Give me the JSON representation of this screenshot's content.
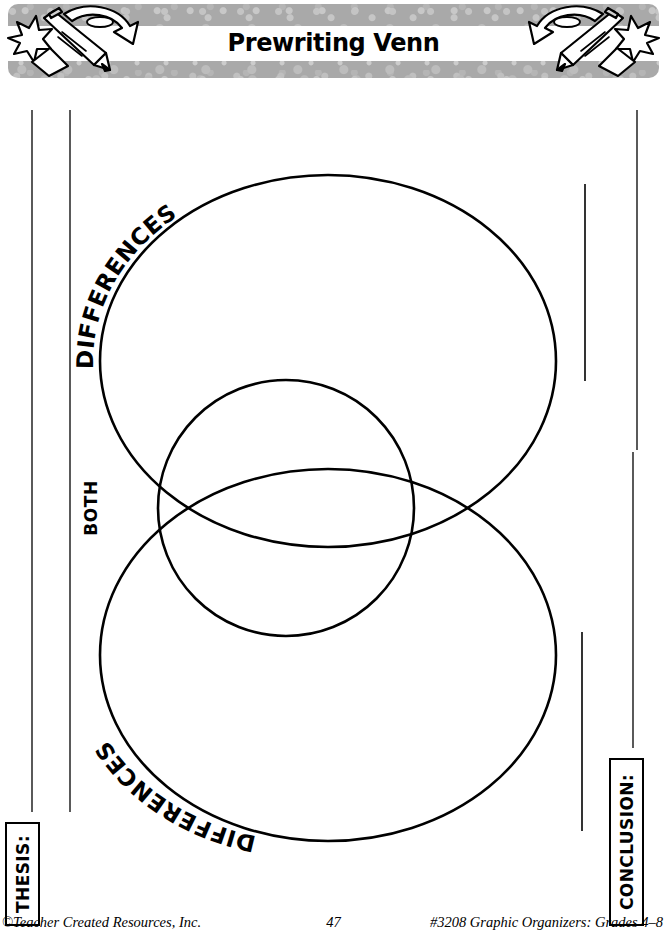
{
  "page": {
    "title": "Prewriting Venn",
    "width": 667,
    "height": 938,
    "background": "#ffffff",
    "ink": "#000000"
  },
  "banner": {
    "title": "Prewriting Venn",
    "band_color": "#a9a9a9",
    "strip_color": "#ffffff",
    "left_art": "pencil-star-paper-arrow-icon",
    "right_art": "pencil-star-paper-arrow-icon"
  },
  "diagram": {
    "type": "venn",
    "orientation": "vertical",
    "labels": {
      "top": "DIFFERENCES",
      "bottom": "DIFFERENCES",
      "middle": "BOTH"
    },
    "shapes": {
      "upper_ellipse": {
        "cx": 328,
        "cy": 283,
        "rx": 228,
        "ry": 186
      },
      "lower_ellipse": {
        "cx": 328,
        "cy": 577,
        "rx": 228,
        "ry": 186
      },
      "middle_circle": {
        "cx": 286,
        "cy": 430,
        "r": 128
      }
    },
    "stroke_width": 2.4
  },
  "writing_lines": {
    "left": [
      {
        "x": 32,
        "y1": 110,
        "y2": 812
      },
      {
        "x": 70,
        "y1": 110,
        "y2": 812
      }
    ],
    "right": [
      {
        "x": 585,
        "y1": 184,
        "y2": 381
      },
      {
        "x": 582,
        "y1": 632,
        "y2": 831
      },
      {
        "x": 637,
        "y1": 110,
        "y2": 450
      },
      {
        "x": 633,
        "y1": 452,
        "y2": 748
      }
    ]
  },
  "boxes": {
    "thesis": "THESIS:",
    "conclusion": "CONCLUSION:"
  },
  "footer": {
    "left": "©Teacher Created Resources, Inc.",
    "center": "47",
    "right": "#3208 Graphic Organizers:  Grades 4–8"
  }
}
